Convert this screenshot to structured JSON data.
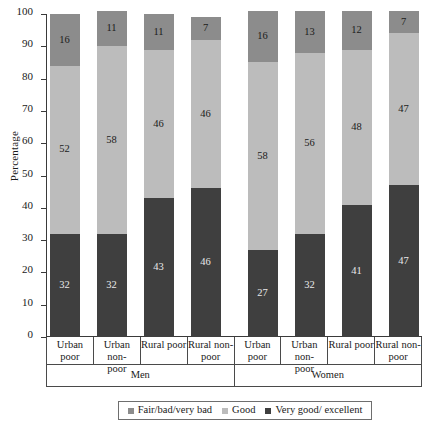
{
  "chart_data": {
    "type": "bar",
    "subtype": "stacked-100-percent",
    "title": "",
    "xlabel": "",
    "ylabel": "Percentage",
    "ylim": [
      0,
      100
    ],
    "yticks": [
      0,
      10,
      20,
      30,
      40,
      50,
      60,
      70,
      80,
      90,
      100
    ],
    "grid": false,
    "legend_position": "bottom",
    "categories": [
      "Urban poor",
      "Urban non-poor",
      "Rural poor",
      "Rural non-poor",
      "Urban poor",
      "Urban non-poor",
      "Rural poor",
      "Rural non-poor"
    ],
    "category_lines": [
      [
        "Urban poor"
      ],
      [
        "Urban non-",
        "poor"
      ],
      [
        "Rural poor"
      ],
      [
        "Rural non-",
        "poor"
      ],
      [
        "Urban poor"
      ],
      [
        "Urban non-",
        "poor"
      ],
      [
        "Rural poor"
      ],
      [
        "Rural non-",
        "poor"
      ]
    ],
    "groups": [
      {
        "label": "Men",
        "span": 4
      },
      {
        "label": "Women",
        "span": 4
      }
    ],
    "series": [
      {
        "name": "Very good/ excellent",
        "color": "#3f3f3f",
        "values": [
          32,
          32,
          43,
          46,
          27,
          32,
          41,
          47
        ]
      },
      {
        "name": "Good",
        "color": "#bcbcbc",
        "values": [
          52,
          58,
          46,
          46,
          58,
          56,
          48,
          47
        ]
      },
      {
        "name": "Fair/bad/very bad",
        "color": "#8c8c8c",
        "values": [
          16,
          11,
          11,
          7,
          16,
          13,
          12,
          7
        ]
      }
    ],
    "stack_order_bottom_to_top": [
      "Very good/ excellent",
      "Good",
      "Fair/bad/very bad"
    ],
    "legend": [
      {
        "label": "Fair/bad/very bad",
        "color": "#8c8c8c"
      },
      {
        "label": "Good",
        "color": "#bcbcbc"
      },
      {
        "label": "Very good/ excellent",
        "color": "#3f3f3f"
      }
    ]
  }
}
